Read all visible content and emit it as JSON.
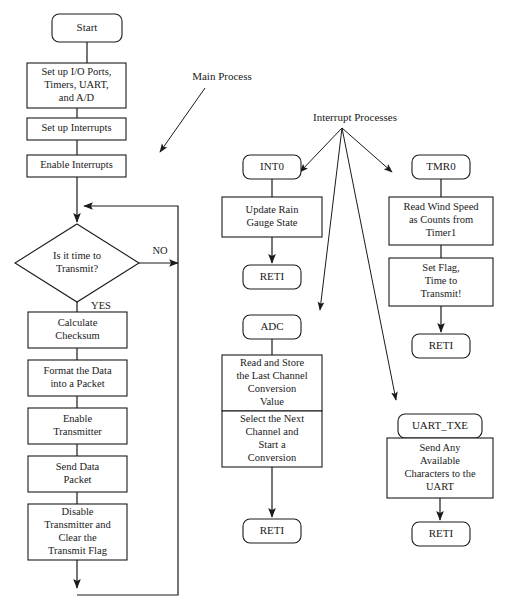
{
  "figure": {
    "width": 508,
    "height": 612,
    "background": "#ffffff",
    "line_color": "#1a1a1a",
    "text_color": "#1a1a1a"
  },
  "chart_data": {
    "type": "diagram",
    "subtype": "flowchart",
    "title": "",
    "annotations": [
      {
        "id": "main-process",
        "text": "Main Process",
        "x": 222,
        "y": 77
      },
      {
        "id": "interrupt-processes",
        "text": "Interrupt Processes",
        "x": 355,
        "y": 118
      }
    ],
    "nodes": [
      {
        "id": "start",
        "shape": "terminator",
        "lines": [
          "Start"
        ],
        "x": 52,
        "y": 14,
        "w": 70,
        "h": 28
      },
      {
        "id": "setup-io",
        "shape": "process",
        "lines": [
          "Set up I/O Ports,",
          "Timers, UART,",
          "and A/D"
        ],
        "x": 27,
        "y": 63,
        "w": 99,
        "h": 45
      },
      {
        "id": "setup-interrupts",
        "shape": "process",
        "lines": [
          "Set up Interrupts"
        ],
        "x": 27,
        "y": 118,
        "w": 99,
        "h": 22
      },
      {
        "id": "enable-interrupts",
        "shape": "process",
        "lines": [
          "Enable Interrupts"
        ],
        "x": 27,
        "y": 155,
        "w": 99,
        "h": 22
      },
      {
        "id": "time-to-transmit",
        "shape": "decision",
        "lines": [
          "Is it time to",
          "Transmit?"
        ],
        "x": 15,
        "y": 224,
        "w": 124,
        "h": 78
      },
      {
        "id": "calculate-checksum",
        "shape": "process",
        "lines": [
          "Calculate",
          "Checksum"
        ],
        "x": 28,
        "y": 312,
        "w": 99,
        "h": 36
      },
      {
        "id": "format-packet",
        "shape": "process",
        "lines": [
          "Format the Data",
          "into a Packet"
        ],
        "x": 28,
        "y": 360,
        "w": 99,
        "h": 36
      },
      {
        "id": "enable-transmitter",
        "shape": "process",
        "lines": [
          "Enable",
          "Transmitter"
        ],
        "x": 28,
        "y": 408,
        "w": 99,
        "h": 36
      },
      {
        "id": "send-data-packet",
        "shape": "process",
        "lines": [
          "Send Data",
          "Packet"
        ],
        "x": 28,
        "y": 456,
        "w": 99,
        "h": 36
      },
      {
        "id": "disable-transmitter",
        "shape": "process",
        "lines": [
          "Disable",
          "Transmitter and",
          "Clear the",
          "Transmit Flag"
        ],
        "x": 28,
        "y": 504,
        "w": 99,
        "h": 56
      },
      {
        "id": "int0",
        "shape": "terminator",
        "lines": [
          "INT0"
        ],
        "x": 243,
        "y": 155,
        "w": 58,
        "h": 24
      },
      {
        "id": "update-rain-gauge",
        "shape": "process",
        "lines": [
          "Update Rain",
          "Gauge State"
        ],
        "x": 222,
        "y": 197,
        "w": 100,
        "h": 40
      },
      {
        "id": "int0-reti",
        "shape": "terminator",
        "lines": [
          "RETI"
        ],
        "x": 243,
        "y": 265,
        "w": 58,
        "h": 24
      },
      {
        "id": "adc",
        "shape": "terminator",
        "lines": [
          "ADC"
        ],
        "x": 243,
        "y": 315,
        "w": 58,
        "h": 24
      },
      {
        "id": "read-store-channel",
        "shape": "process",
        "lines": [
          "Read and Store",
          "the Last Channel",
          "Conversion",
          "Value"
        ],
        "x": 222,
        "y": 355,
        "w": 100,
        "h": 56
      },
      {
        "id": "select-next-channel",
        "shape": "process",
        "lines": [
          "Select the Next",
          "Channel and",
          "Start a",
          "Conversion"
        ],
        "x": 222,
        "y": 411,
        "w": 100,
        "h": 56
      },
      {
        "id": "adc-reti",
        "shape": "terminator",
        "lines": [
          "RETI"
        ],
        "x": 243,
        "y": 519,
        "w": 58,
        "h": 24
      },
      {
        "id": "tmr0",
        "shape": "terminator",
        "lines": [
          "TMR0"
        ],
        "x": 412,
        "y": 155,
        "w": 58,
        "h": 24
      },
      {
        "id": "read-wind-speed",
        "shape": "process",
        "lines": [
          "Read Wind Speed",
          "as Counts from",
          "Timer1"
        ],
        "x": 389,
        "y": 197,
        "w": 104,
        "h": 48
      },
      {
        "id": "set-flag",
        "shape": "process",
        "lines": [
          "Set Flag,",
          "Time to",
          "Transmit!"
        ],
        "x": 389,
        "y": 258,
        "w": 104,
        "h": 48
      },
      {
        "id": "tmr0-reti",
        "shape": "terminator",
        "lines": [
          "RETI"
        ],
        "x": 412,
        "y": 334,
        "w": 58,
        "h": 24
      },
      {
        "id": "uart-txe",
        "shape": "terminator",
        "lines": [
          "UART_TXE"
        ],
        "x": 398,
        "y": 414,
        "w": 84,
        "h": 24
      },
      {
        "id": "send-characters",
        "shape": "process",
        "lines": [
          "Send Any",
          "Available",
          "Characters to the",
          "UART"
        ],
        "x": 387,
        "y": 438,
        "w": 106,
        "h": 60
      },
      {
        "id": "uart-reti",
        "shape": "terminator",
        "lines": [
          "RETI"
        ],
        "x": 412,
        "y": 522,
        "w": 58,
        "h": 24
      }
    ],
    "edges": [
      {
        "id": "e-start-setupio",
        "from": "start",
        "to": "setup-io",
        "points": "87,42 87,63",
        "arrow": false
      },
      {
        "id": "e-setupio-setupint",
        "from": "setup-io",
        "to": "setup-interrupts",
        "points": "77,108 77,118",
        "arrow": false
      },
      {
        "id": "e-setupint-enableint",
        "from": "setup-interrupts",
        "to": "enable-interrupts",
        "points": "77,140 77,155",
        "arrow": false
      },
      {
        "id": "e-enableint-decision",
        "from": "enable-interrupts",
        "to": "time-to-transmit",
        "points": "77,177 77,222",
        "arrow": true
      },
      {
        "id": "e-decision-yes",
        "from": "time-to-transmit",
        "to": "calculate-checksum",
        "points": "77,302 77,312",
        "arrow": false
      },
      {
        "id": "e-checksum-format",
        "from": "calculate-checksum",
        "to": "format-packet",
        "points": "77,348 77,360",
        "arrow": false
      },
      {
        "id": "e-format-enabletx",
        "from": "format-packet",
        "to": "enable-transmitter",
        "points": "77,396 77,408",
        "arrow": false
      },
      {
        "id": "e-enabletx-send",
        "from": "enable-transmitter",
        "to": "send-data-packet",
        "points": "77,444 77,456",
        "arrow": false
      },
      {
        "id": "e-send-disable",
        "from": "send-data-packet",
        "to": "disable-transmitter",
        "points": "77,492 77,504",
        "arrow": false
      },
      {
        "id": "e-disable-down",
        "from": "disable-transmitter",
        "to": "loop-bottom",
        "points": "77,560 77,588",
        "arrow": true
      },
      {
        "id": "e-loop-back",
        "from": "loop-bottom",
        "to": "time-to-transmit",
        "points": "77,595 178,595 178,206 84,206",
        "arrow": true
      },
      {
        "id": "e-decision-no",
        "from": "time-to-transmit",
        "to": "loop-right",
        "points": "139,263 178,263",
        "arrow": true
      },
      {
        "id": "e-int0-update",
        "from": "int0",
        "to": "update-rain-gauge",
        "points": "272,179 272,197",
        "arrow": false
      },
      {
        "id": "e-update-reti",
        "from": "update-rain-gauge",
        "to": "int0-reti",
        "points": "272,237 272,263",
        "arrow": true
      },
      {
        "id": "e-adc-read",
        "from": "adc",
        "to": "read-store-channel",
        "points": "272,339 272,355",
        "arrow": false
      },
      {
        "id": "e-read-select",
        "from": "read-store-channel",
        "to": "select-next-channel",
        "points": "272,411 272,411",
        "arrow": false
      },
      {
        "id": "e-select-reti",
        "from": "select-next-channel",
        "to": "adc-reti",
        "points": "272,467 272,517",
        "arrow": true
      },
      {
        "id": "e-tmr0-read",
        "from": "tmr0",
        "to": "read-wind-speed",
        "points": "441,179 441,197",
        "arrow": false
      },
      {
        "id": "e-read-setflag",
        "from": "read-wind-speed",
        "to": "set-flag",
        "points": "441,245 441,258",
        "arrow": false
      },
      {
        "id": "e-setflag-reti",
        "from": "set-flag",
        "to": "tmr0-reti",
        "points": "441,306 441,332",
        "arrow": true
      },
      {
        "id": "e-uarttxe-send",
        "from": "uart-txe",
        "to": "send-characters",
        "points": "440,438 440,438",
        "arrow": false
      },
      {
        "id": "e-sendchars-reti",
        "from": "send-characters",
        "to": "uart-reti",
        "points": "440,498 440,520",
        "arrow": true
      }
    ],
    "annotation_arrows": [
      {
        "id": "a-main-process",
        "points": "205,88 160,152",
        "arrow": true
      },
      {
        "id": "a-int-to-int0",
        "points": "342,128 300,172",
        "arrow": true
      },
      {
        "id": "a-int-to-adc",
        "points": "342,128 320,310",
        "arrow": true
      },
      {
        "id": "a-int-to-tmr0",
        "points": "342,128 392,172",
        "arrow": true
      },
      {
        "id": "a-int-to-uart",
        "points": "342,128 396,400",
        "arrow": true
      }
    ],
    "edge_labels": [
      {
        "id": "label-no",
        "text": "NO",
        "x": 160,
        "y": 252
      },
      {
        "id": "label-yes",
        "text": "YES",
        "x": 101,
        "y": 307
      }
    ]
  }
}
